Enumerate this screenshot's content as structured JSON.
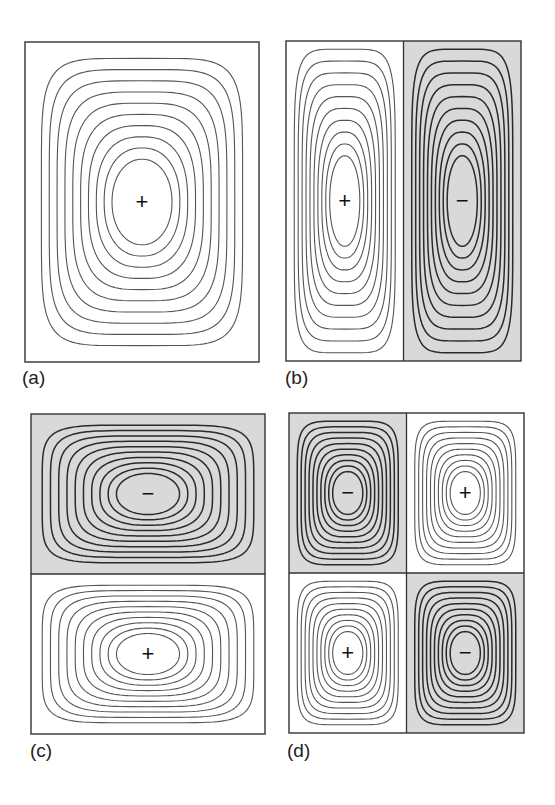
{
  "figure": {
    "shade_color": "#d9d9d9",
    "line_color_light": "#555555",
    "line_color_dark": "#2a2a2a",
    "border_color": "#333333",
    "panels": [
      {
        "id": "a",
        "label": "(a)",
        "grid": [
          1,
          1
        ],
        "cells": [
          {
            "sign": "+",
            "shaded": false
          }
        ]
      },
      {
        "id": "b",
        "label": "(b)",
        "grid": [
          2,
          1
        ],
        "cells": [
          {
            "sign": "+",
            "shaded": false
          },
          {
            "sign": "−",
            "shaded": true
          }
        ]
      },
      {
        "id": "c",
        "label": "(c)",
        "grid": [
          1,
          2
        ],
        "cells": [
          {
            "sign": "−",
            "shaded": true
          },
          {
            "sign": "+",
            "shaded": false
          }
        ]
      },
      {
        "id": "d",
        "label": "(d)",
        "grid": [
          2,
          2
        ],
        "cells": [
          {
            "sign": "−",
            "shaded": true
          },
          {
            "sign": "+",
            "shaded": false
          },
          {
            "sign": "+",
            "shaded": false
          },
          {
            "sign": "−",
            "shaded": true
          }
        ]
      }
    ]
  }
}
